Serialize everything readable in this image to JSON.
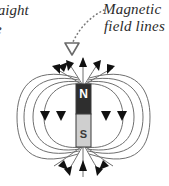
{
  "figure": {
    "title_fragments": {
      "line1": "raight",
      "line2": "e"
    },
    "annotation": {
      "line1": "Magnetic",
      "line2": "field lines",
      "pointer": "dotted-curved-arrow"
    },
    "magnet": {
      "north_label": "N",
      "south_label": "S",
      "north_color": "#2e2e2e",
      "south_color": "#cfcfcf",
      "outline_color": "#3a3a3a"
    },
    "field": {
      "line_color": "#6f6f6f",
      "arrow_color": "#111111",
      "loop_count_per_side": 4,
      "direction": "north-to-south"
    },
    "background_color": "#ffffff"
  }
}
